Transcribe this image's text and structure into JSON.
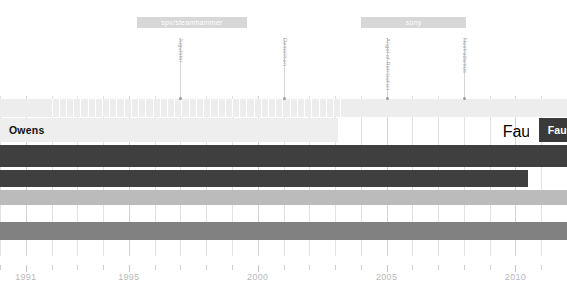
{
  "chart_data": {
    "type": "bar",
    "title": "",
    "subtitle": "",
    "xlabel": "",
    "ylabel": "",
    "xlim": [
      1990.0,
      2012.0
    ],
    "grid": true,
    "legend_position": "none",
    "axis": {
      "tick_labels": [
        "1991",
        "1995",
        "2000",
        "2005",
        "2010"
      ],
      "tick_values": [
        1991,
        1995,
        2000,
        2005,
        2010
      ],
      "minor_tick_values": [
        1990,
        1992,
        1993,
        1994,
        1996,
        1997,
        1998,
        1999,
        2001,
        2002,
        2003,
        2004,
        2006,
        2007,
        2008,
        2009,
        2011,
        2012
      ]
    },
    "label_bars": [
      {
        "label": "spv/steamhammer",
        "start": 1995.3,
        "end": 1999.6
      },
      {
        "label": "sony",
        "start": 2004.0,
        "end": 2008.1
      }
    ],
    "annotations": [
      {
        "label": "Jugulator",
        "value": 1997.0
      },
      {
        "label": "Demolition",
        "value": 2001.0
      },
      {
        "label": "Angel of Retribution",
        "value": 2005.0
      },
      {
        "label": "Nostradamus",
        "value": 2008.0
      }
    ],
    "series": [
      {
        "name": "Owens",
        "label": "Owens",
        "start": 1990.0,
        "end": 2003.1,
        "color": "#eeeeee",
        "label_color": "dark",
        "row": 0,
        "open_start": false
      },
      {
        "name": "Faulkner",
        "label": "Faulkner",
        "start": 2010.9,
        "end": 2012.0,
        "color": "#3a3a3a",
        "label_color": "light",
        "row": 0,
        "open_start": false
      },
      {
        "name": "bar-2",
        "label": "",
        "start": 1990.0,
        "end": 2012.0,
        "color": "#3f3f3f",
        "label_color": "dark",
        "row": 1,
        "open_start": true
      },
      {
        "name": "bar-3",
        "label": "",
        "start": 1990.0,
        "end": 2010.5,
        "color": "#3f3f3f",
        "label_color": "dark",
        "row": 2,
        "open_start": true
      },
      {
        "name": "bar-4",
        "label": "",
        "start": 1990.0,
        "end": 2012.0,
        "color": "#bbbbbb",
        "label_color": "dark",
        "row": 3,
        "open_start": true
      },
      {
        "name": "bar-5",
        "label": "",
        "start": 1990.0,
        "end": 2012.0,
        "color": "#818181",
        "label_color": "dark",
        "row": 4,
        "open_start": true
      }
    ],
    "band": {
      "start": 1990.0,
      "end": 2012.0,
      "color": "#ededed"
    },
    "colors": {
      "grid": "#e2e2e2",
      "axis_text": "#b9b9b9",
      "label_bar": "#d7d7d7",
      "annotation": "#a8a8a8",
      "dark_bar": "#3f3f3f",
      "mid_bar": "#818181",
      "light_bar": "#bbbbbb",
      "pale_bar": "#eeeeee",
      "baseline": "#c9c9c9"
    }
  }
}
